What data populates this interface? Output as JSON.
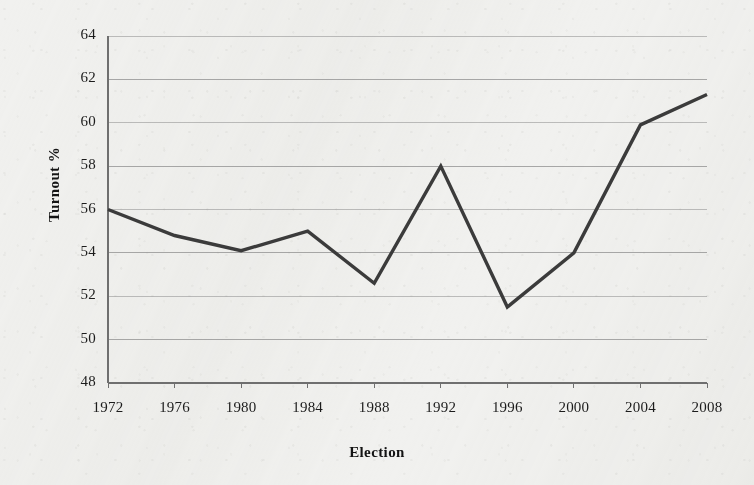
{
  "chart_data": {
    "type": "line",
    "title": "",
    "subtitle": "",
    "xlabel": "Election",
    "ylabel": "Turnout %",
    "categories": [
      "1972",
      "1976",
      "1980",
      "1984",
      "1988",
      "1992",
      "1996",
      "2000",
      "2004",
      "2008"
    ],
    "values": [
      56.0,
      54.8,
      54.1,
      55.0,
      52.6,
      58.0,
      51.5,
      54.0,
      59.9,
      61.3
    ],
    "series": [
      {
        "name": "Turnout %",
        "values": [
          56.0,
          54.8,
          54.1,
          55.0,
          52.6,
          58.0,
          51.5,
          54.0,
          59.9,
          61.3
        ]
      }
    ],
    "ylim": [
      48,
      64
    ],
    "y_ticks": [
      48,
      50,
      52,
      54,
      56,
      58,
      60,
      62,
      64
    ],
    "y_tick_labels": [
      "48",
      "50",
      "52",
      "54",
      "56",
      "58",
      "60",
      "62",
      "64"
    ],
    "x_tick_labels": [
      "1972",
      "1976",
      "1980",
      "1984",
      "1988",
      "1992",
      "1996",
      "2000",
      "2004",
      "2008"
    ],
    "grid": true,
    "grid_axis": "y",
    "legend": false,
    "legend_position": "none",
    "annotations": [],
    "line_color": "#3b3b3b",
    "grid_color": "#8e8e8e",
    "axis_color": "#6f6f6f",
    "text_color": "#1c1c1c",
    "background_color": "#f1f1ef"
  },
  "figure": {
    "y_axis_title": "Turnout %",
    "x_axis_title": "Election"
  }
}
